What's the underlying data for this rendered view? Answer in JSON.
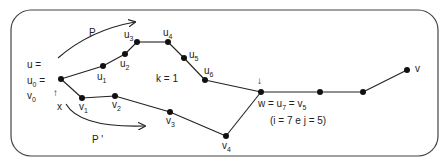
{
  "diagram": {
    "frame": {
      "x": 11,
      "y": 10,
      "width": 427,
      "height": 146,
      "radius": 20,
      "stroke": "#444444"
    },
    "colors": {
      "line": "#222222",
      "node": "#111111",
      "text": "#222222"
    },
    "labels": {
      "start_line1": "u =",
      "start_line2_base": "u",
      "start_line2_sub": "0",
      "start_line2_tail": " =",
      "start_line3_base": "v",
      "start_line3_sub": "0",
      "up_arrow": "↑",
      "x": "x",
      "path_p": "P",
      "path_p_prime": "P '",
      "k": "k = 1",
      "down_arrow": "↓",
      "w_eq": "w = u",
      "w_sub7": "7",
      "w_eq2": " = v",
      "w_sub5": "5",
      "indices": "(i = 7 e j = 5)",
      "v": "v"
    },
    "nodes": [
      {
        "id": "u0",
        "x": 61,
        "y": 79,
        "base": "",
        "sub": ""
      },
      {
        "id": "u1",
        "x": 103,
        "y": 66,
        "base": "u",
        "sub": "1"
      },
      {
        "id": "u2",
        "x": 125,
        "y": 54,
        "base": "u",
        "sub": "2"
      },
      {
        "id": "u3",
        "x": 137,
        "y": 42,
        "base": "u",
        "sub": "3"
      },
      {
        "id": "u4",
        "x": 168,
        "y": 42,
        "base": "u",
        "sub": "4"
      },
      {
        "id": "u5",
        "x": 184,
        "y": 58,
        "base": "u",
        "sub": "5"
      },
      {
        "id": "u6",
        "x": 205,
        "y": 80,
        "base": "u",
        "sub": "6"
      },
      {
        "id": "w",
        "x": 261,
        "y": 92,
        "base": "",
        "sub": ""
      },
      {
        "id": "v1",
        "x": 82,
        "y": 98,
        "base": "v",
        "sub": "1"
      },
      {
        "id": "v2",
        "x": 115,
        "y": 96,
        "base": "v",
        "sub": "2"
      },
      {
        "id": "v3",
        "x": 170,
        "y": 112,
        "base": "v",
        "sub": "3"
      },
      {
        "id": "v4",
        "x": 226,
        "y": 136,
        "base": "v",
        "sub": "4"
      },
      {
        "id": "n8",
        "x": 320,
        "y": 92,
        "base": "",
        "sub": ""
      },
      {
        "id": "n9",
        "x": 363,
        "y": 92,
        "base": "",
        "sub": ""
      },
      {
        "id": "v",
        "x": 407,
        "y": 70,
        "base": "",
        "sub": ""
      }
    ],
    "edges": [
      [
        "u0",
        "u1"
      ],
      [
        "u1",
        "u2"
      ],
      [
        "u2",
        "u3"
      ],
      [
        "u3",
        "u4"
      ],
      [
        "u4",
        "u5"
      ],
      [
        "u5",
        "u6"
      ],
      [
        "u6",
        "w"
      ],
      [
        "u0",
        "v1"
      ],
      [
        "v1",
        "v2"
      ],
      [
        "v2",
        "v3"
      ],
      [
        "v3",
        "v4"
      ],
      [
        "v4",
        "w"
      ],
      [
        "w",
        "n8"
      ],
      [
        "n8",
        "n9"
      ],
      [
        "n9",
        "v"
      ]
    ]
  }
}
